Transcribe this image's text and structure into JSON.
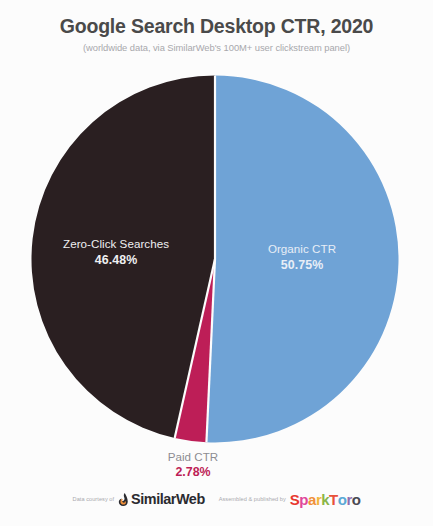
{
  "header": {
    "title": "Google Search Desktop CTR, 2020",
    "subtitle": "(worldwide data, via SimilarWeb's 100M+ user clickstream panel)"
  },
  "footer": {
    "data_courtesy_text": "Data courtesy of",
    "similarweb_wordmark": "SimilarWeb",
    "similarweb_mark_icon": "similarweb-flame-icon",
    "published_by_text": "Assembled & published by",
    "sparktoro_letters": [
      {
        "char": "S",
        "color": "#e8392f"
      },
      {
        "char": "p",
        "color": "#e0489a"
      },
      {
        "char": "a",
        "color": "#f0903a"
      },
      {
        "char": "r",
        "color": "#f2b63c"
      },
      {
        "char": "k",
        "color": "#8ab648"
      },
      {
        "char": "T",
        "color": "#e8513a"
      },
      {
        "char": "o",
        "color": "#5aa9d6"
      },
      {
        "char": "r",
        "color": "#8e6fb0"
      },
      {
        "char": "o",
        "color": "#4a4a52"
      }
    ]
  },
  "colors": {
    "background": "#fcfcfc",
    "title_text": "#4a4a4a",
    "subtitle_text": "#a8a8ac",
    "organic": "#6fa3d6",
    "zero_click": "#2a1f21",
    "paid": "#bd1e57",
    "slice_gap": "#fcfcfc"
  },
  "chart_data": {
    "type": "pie",
    "title": "Google Search Desktop CTR, 2020",
    "subtitle": "(worldwide data, via SimilarWeb's 100M+ user clickstream panel)",
    "xlabel": "",
    "ylabel": "",
    "units": "percent",
    "total": 100.01,
    "start_angle_deg": 0,
    "direction": "clockwise",
    "grid": false,
    "legend": "none",
    "labels_inside_slices": true,
    "slices": [
      {
        "name": "Organic CTR",
        "value": 50.75,
        "value_label": "50.75%",
        "color": "#6fa3d6",
        "label_color": "#e8eef6",
        "label_position": "inside-right"
      },
      {
        "name": "Paid CTR",
        "value": 2.78,
        "value_label": "2.78%",
        "color": "#bd1e57",
        "label_color": "#bd1e57",
        "label_position": "below-bottom"
      },
      {
        "name": "Zero-Click Searches",
        "value": 46.48,
        "value_label": "46.48%",
        "color": "#2a1f21",
        "label_color": "#efeff1",
        "label_position": "inside-left"
      }
    ]
  }
}
